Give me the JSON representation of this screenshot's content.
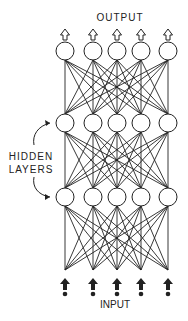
{
  "labels": {
    "output": "OUTPUT",
    "hidden_line1": "HIDDEN",
    "hidden_line2": "LAYERS",
    "input": "INPUT"
  },
  "network": {
    "node_x": [
      65,
      93,
      117,
      141,
      168
    ],
    "layers": [
      {
        "name": "output",
        "y": 51
      },
      {
        "name": "hidden-1",
        "y": 123
      },
      {
        "name": "hidden-2",
        "y": 197
      }
    ],
    "input_y": 270,
    "node_radius": 9,
    "colors": {
      "stroke": "#222222",
      "fill": "#ffffff"
    }
  }
}
